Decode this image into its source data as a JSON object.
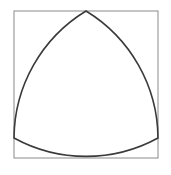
{
  "figure": {
    "background_color": "#ffffff",
    "canvas": {
      "width": 171,
      "height": 175
    }
  },
  "square": {
    "label": "bounding square",
    "x": 14,
    "y": 11,
    "width": 144,
    "height": 147,
    "stroke_color": "#8a8a8a",
    "stroke_width": 1,
    "fill": "none"
  },
  "reuleaux_triangle": {
    "label": "Reuleaux triangle (curved triangle of constant width)",
    "stroke_color": "#3a3a3a",
    "stroke_width": 1.6,
    "fill": "none",
    "vertices": [
      {
        "name": "apex-top",
        "x": 86,
        "y": 11
      },
      {
        "name": "vertex-bottom-right",
        "x": 158,
        "y": 138
      },
      {
        "name": "vertex-bottom-left",
        "x": 14,
        "y": 138
      }
    ],
    "arcs": [
      {
        "name": "arc-right",
        "from": "apex-top",
        "to": "vertex-bottom-right",
        "radius": 150,
        "sweep": 1,
        "bulge": "outward"
      },
      {
        "name": "arc-bottom",
        "from": "vertex-bottom-right",
        "to": "vertex-bottom-left",
        "radius": 150,
        "sweep": 1,
        "bulge": "downward"
      },
      {
        "name": "arc-left",
        "from": "vertex-bottom-left",
        "to": "apex-top",
        "radius": 150,
        "sweep": 1,
        "bulge": "outward"
      }
    ],
    "path_d": "M 86 11 A 150 150 0 0 1 158 138 A 150 150 0 0 1 14 138 A 150 150 0 0 1 86 11 Z"
  }
}
